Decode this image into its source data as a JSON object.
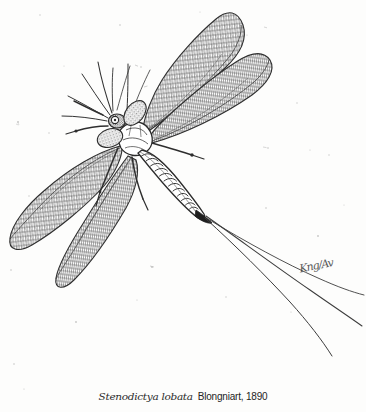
{
  "plate": {
    "kind": "scientific-illustration",
    "subject": "fossil winged insect (palaeodictyopteran) in dorsal view",
    "technique": "pen-and-ink stipple and line engraving",
    "background_color": "#fdfdfc",
    "ink_color": "#2b2b2b",
    "width": 366,
    "height": 412
  },
  "caption": {
    "scientific_name": "Stenodictya lobata",
    "authority": "Blongniart, 1890"
  },
  "signature": {
    "text": "Kng/Av"
  },
  "specimen": {
    "body_parts": [
      {
        "name": "head",
        "label": "head"
      },
      {
        "name": "compound-eye",
        "label": "compound eye"
      },
      {
        "name": "antenna",
        "label": "antenna"
      },
      {
        "name": "thorax",
        "label": "thorax"
      },
      {
        "name": "abdomen",
        "label": "segmented abdomen"
      },
      {
        "name": "forewing-left",
        "label": "left forewing"
      },
      {
        "name": "forewing-right",
        "label": "right forewing"
      },
      {
        "name": "hindwing-left",
        "label": "left hindwing"
      },
      {
        "name": "hindwing-right",
        "label": "right hindwing"
      },
      {
        "name": "cercus",
        "label": "cercus"
      },
      {
        "name": "leg",
        "label": "leg"
      }
    ],
    "abdomen_segments": 14,
    "cerci_count": 3,
    "wing_count": 4
  }
}
